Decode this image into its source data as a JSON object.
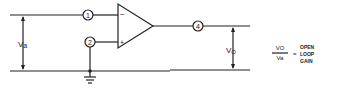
{
  "diagram": {
    "nodes": [
      {
        "id": "1",
        "label": "1"
      },
      {
        "id": "2",
        "label": "2"
      },
      {
        "id": "4",
        "label": "4"
      }
    ],
    "opamp": {
      "minus": "−",
      "plus": "+"
    },
    "input_voltage": {
      "symbol": "V",
      "sub": "a"
    },
    "output_voltage": {
      "symbol": "V",
      "sub": "O"
    },
    "formula": {
      "numerator": "VO",
      "denominator": "Va",
      "equals": "=",
      "result_lines": [
        "OPEN",
        "LOOP",
        "GAIN"
      ]
    }
  }
}
